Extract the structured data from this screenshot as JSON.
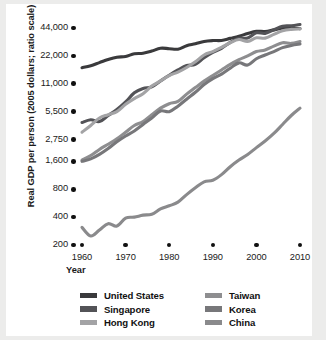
{
  "chart_data": {
    "type": "line",
    "title": "",
    "xlabel": "Year",
    "ylabel": "Real GDP per person (2005 dollars; ratio scale)",
    "scale": "log",
    "grid": false,
    "legend_position": "bottom",
    "xlim": [
      1958,
      2011
    ],
    "ylim": [
      200,
      50000
    ],
    "ytick_labels": [
      "44,000",
      "22,000",
      "11,000",
      "5,500",
      "2,750",
      "1,600",
      "800",
      "400",
      "200"
    ],
    "ytick_values": [
      44000,
      22000,
      11000,
      5500,
      2750,
      1600,
      800,
      400,
      200
    ],
    "xtick_labels": [
      "1960",
      "1970",
      "1980",
      "1990",
      "2000",
      "2010"
    ],
    "xtick_values": [
      1960,
      1970,
      1980,
      1990,
      2000,
      2010
    ],
    "x": [
      1960,
      1962,
      1964,
      1966,
      1968,
      1970,
      1972,
      1974,
      1976,
      1978,
      1980,
      1982,
      1984,
      1986,
      1988,
      1990,
      1992,
      1994,
      1996,
      1998,
      2000,
      2002,
      2004,
      2006,
      2008,
      2010
    ],
    "series": [
      {
        "name": "United States",
        "color": "#3a3a3c",
        "values": [
          16400,
          17200,
          18600,
          20100,
          21300,
          21700,
          23200,
          23500,
          24800,
          26600,
          26300,
          26000,
          28300,
          29700,
          31500,
          32200,
          32300,
          34000,
          35800,
          38400,
          40500,
          40300,
          42000,
          43800,
          43800,
          43300
        ]
      },
      {
        "name": "Singapore",
        "color": "#535357",
        "values": [
          4200,
          4500,
          4300,
          5000,
          5800,
          7000,
          8800,
          9800,
          10200,
          11800,
          13600,
          15500,
          17300,
          17800,
          21000,
          24000,
          26500,
          30800,
          34000,
          34400,
          39000,
          38500,
          42000,
          46000,
          46500,
          48000
        ]
      },
      {
        "name": "Hong Kong",
        "color": "#a3a3a5",
        "values": [
          3300,
          3900,
          4700,
          5100,
          5500,
          6600,
          7600,
          8600,
          10400,
          11800,
          13500,
          14700,
          16500,
          19000,
          22500,
          24500,
          27200,
          30500,
          33000,
          31500,
          34500,
          34200,
          37500,
          41000,
          42500,
          43000
        ]
      },
      {
        "name": "Taiwan",
        "color": "#8e8e90",
        "values": [
          1650,
          1850,
          2150,
          2450,
          2800,
          3300,
          3900,
          4300,
          5100,
          6000,
          6700,
          7100,
          8500,
          10000,
          11800,
          13500,
          15500,
          17800,
          20000,
          22000,
          24500,
          25500,
          28000,
          30500,
          30000,
          31500
        ]
      },
      {
        "name": "Korea",
        "color": "#77777a",
        "values": [
          1600,
          1700,
          1900,
          2200,
          2600,
          3000,
          3400,
          4000,
          4700,
          5600,
          5500,
          6300,
          7500,
          8900,
          10800,
          12500,
          14000,
          16200,
          18500,
          17500,
          20500,
          22500,
          24500,
          27000,
          28500,
          29500
        ]
      },
      {
        "name": "China",
        "color": "#8a8a8c",
        "values": [
          310,
          250,
          290,
          340,
          320,
          390,
          400,
          420,
          430,
          490,
          530,
          580,
          700,
          830,
          960,
          1000,
          1150,
          1400,
          1650,
          1900,
          2250,
          2650,
          3200,
          4000,
          5000,
          6000
        ]
      }
    ]
  },
  "axes": {
    "y_title": "Real GDP per person (2005 dollars; ratio scale)",
    "x_title": "Year"
  },
  "legend": {
    "left_column": [
      {
        "label": "United States",
        "color": "#3a3a3c"
      },
      {
        "label": "Singapore",
        "color": "#535357"
      },
      {
        "label": "Hong Kong",
        "color": "#a3a3a5"
      }
    ],
    "right_column": [
      {
        "label": "Taiwan",
        "color": "#8e8e90"
      },
      {
        "label": "Korea",
        "color": "#77777a"
      },
      {
        "label": "China",
        "color": "#8a8a8c"
      }
    ]
  }
}
